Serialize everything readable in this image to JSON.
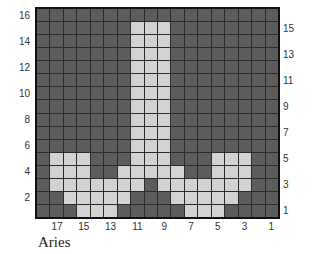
{
  "caption": "Aries",
  "grid": {
    "columns": 18,
    "rows": 16,
    "column_order": "18 (left) to 1 (right)",
    "row_order": "16 (top) to 1 (bottom)",
    "colors": {
      "dark": "#5c5c5c",
      "light": "#d2d2d2",
      "lines": "#2b2b2b",
      "border": "#111111"
    },
    "light_cells_by_row": {
      "16": [],
      "15": [
        11,
        10,
        9
      ],
      "14": [
        11,
        10,
        9
      ],
      "13": [
        11,
        10,
        9
      ],
      "12": [
        11,
        10,
        9
      ],
      "11": [
        11,
        10,
        9
      ],
      "10": [
        11,
        10,
        9
      ],
      "9": [
        11,
        10,
        9
      ],
      "8": [
        11,
        10,
        9
      ],
      "7": [
        11,
        10,
        9
      ],
      "6": [
        11,
        10,
        9
      ],
      "5": [
        17,
        16,
        15,
        11,
        10,
        9,
        5,
        4,
        3
      ],
      "4": [
        17,
        16,
        15,
        12,
        11,
        10,
        9,
        8,
        5,
        4,
        3
      ],
      "3": [
        17,
        16,
        15,
        14,
        13,
        12,
        11,
        9,
        8,
        7,
        6,
        5,
        4,
        3
      ],
      "2": [
        16,
        15,
        14,
        13,
        12,
        8,
        7,
        6,
        5,
        4
      ],
      "1": [
        15,
        14,
        13,
        7,
        6,
        5
      ]
    }
  },
  "axis": {
    "left_row_labels": [
      "16",
      "14",
      "12",
      "10",
      "8",
      "6",
      "4",
      "2"
    ],
    "right_row_labels": [
      "15",
      "13",
      "11",
      "9",
      "7",
      "5",
      "3",
      "1"
    ],
    "bottom_column_labels": [
      "17",
      "15",
      "13",
      "11",
      "9",
      "7",
      "5",
      "3",
      "1"
    ]
  }
}
